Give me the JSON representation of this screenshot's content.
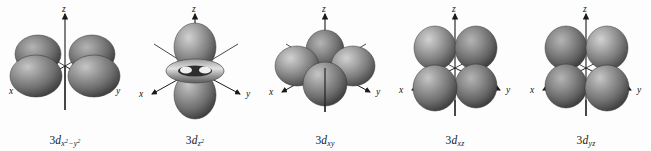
{
  "figure": {
    "background_color": "#fdfdfd",
    "lobe_color_light": "#b9b9b9",
    "lobe_color_mid": "#8a8a8a",
    "lobe_color_dark": "#4a4a4a",
    "axis_color": "#1a1a1a",
    "text_color": "#141414"
  },
  "axes": {
    "x": "x",
    "y": "y",
    "z": "z"
  },
  "orbitals": [
    {
      "id": "3d-x2-y2",
      "shell": "3",
      "subshell": "d",
      "subscript": "x2 - y2",
      "caption": "3dx2−y2",
      "lobe_count": 4,
      "has_torus": false,
      "orientation": "lobes along x and y axes, in the horizontal plane"
    },
    {
      "id": "3d-z2",
      "shell": "3",
      "subshell": "d",
      "subscript": "z2",
      "caption": "3dz2",
      "lobe_count": 2,
      "has_torus": true,
      "orientation": "two lobes along the z axis with a torus around the waist"
    },
    {
      "id": "3d-xy",
      "shell": "3",
      "subshell": "d",
      "subscript": "xy",
      "caption": "3dxy",
      "lobe_count": 4,
      "has_torus": false,
      "orientation": "four lobes between the x and y axes in the horizontal plane"
    },
    {
      "id": "3d-xz",
      "shell": "3",
      "subshell": "d",
      "subscript": "xz",
      "caption": "3dxz",
      "lobe_count": 4,
      "has_torus": false,
      "orientation": "four lobes between the x and z axes in the xz plane"
    },
    {
      "id": "3d-yz",
      "shell": "3",
      "subshell": "d",
      "subscript": "yz",
      "caption": "3dyz",
      "lobe_count": 4,
      "has_torus": false,
      "orientation": "four lobes between the y and z axes in the yz plane"
    }
  ]
}
